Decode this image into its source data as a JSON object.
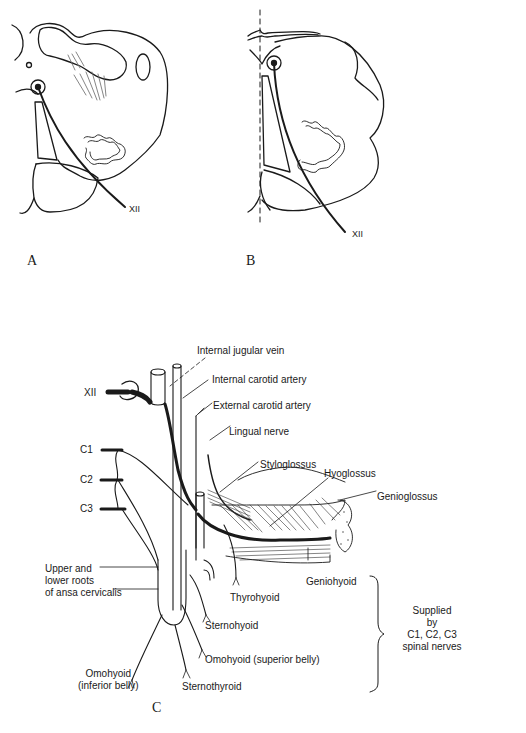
{
  "figure": {
    "panels": [
      {
        "id": "A",
        "letter": "A",
        "nerve_label": "XII"
      },
      {
        "id": "B",
        "letter": "B",
        "nerve_label": "XII"
      },
      {
        "id": "C",
        "letter": "C"
      }
    ],
    "panel_c": {
      "nerve_labels": {
        "xii": "XII",
        "c1": "C1",
        "c2": "C2",
        "c3": "C3"
      },
      "vessel_labels": {
        "internal_jugular_vein": "Internal jugular vein",
        "internal_carotid_artery": "Internal carotid artery",
        "external_carotid_artery": "External carotid artery",
        "lingual_nerve": "Lingual nerve"
      },
      "muscle_labels": {
        "styloglossus": "Styloglossus",
        "hyoglossus": "Hyoglossus",
        "genioglossus": "Genioglossus",
        "geniohyoid": "Geniohyoid",
        "thyrohyoid": "Thyrohyoid",
        "sternohyoid": "Sternohyoid",
        "omohyoid_superior": "Omohyoid (superior belly)",
        "omohyoid_inferior_line1": "Omohyoid",
        "omohyoid_inferior_line2": "(inferior belly)",
        "sternothyroid": "Sternothyroid"
      },
      "ansa_label": {
        "line1": "Upper and",
        "line2": "lower roots",
        "line3": "of ansa cervicalis"
      },
      "bracket_note": {
        "line1": "Supplied",
        "line2": "by",
        "line3": "C1, C2, C3",
        "line4": "spinal nerves"
      }
    }
  }
}
